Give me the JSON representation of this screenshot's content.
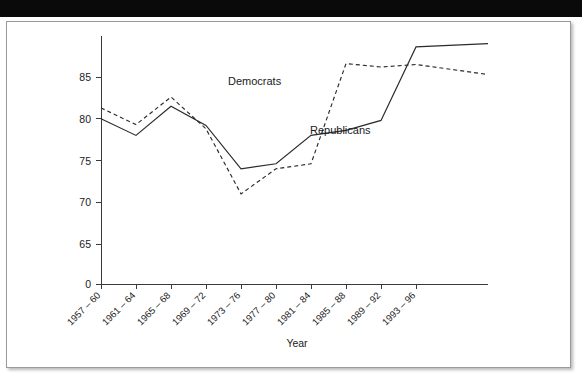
{
  "banner": {
    "label": ""
  },
  "figure": {
    "axis_title_x": "Year",
    "axis_title_y": "",
    "labels": {
      "democrats": "Democrats",
      "republicans": "Republicans"
    }
  },
  "chart_data": {
    "type": "line",
    "title": "",
    "xlabel": "Year",
    "ylabel": "",
    "grid": false,
    "legend": "inline-annotations",
    "ylim": [
      62.5,
      90.5
    ],
    "y_axis_break": true,
    "yticks": [
      0,
      65,
      70,
      75,
      80,
      85
    ],
    "ytick_labels": [
      "0",
      "65",
      "70",
      "75",
      "80",
      "85"
    ],
    "categories": [
      "1957 – 60",
      "1961 – 64",
      "1965 – 68",
      "1969 – 72",
      "1973 – 76",
      "1977 – 80",
      "1981 – 84",
      "1985 – 88",
      "1989 – 92",
      "1993 – 96"
    ],
    "series": [
      {
        "name": "Republicans",
        "style": "solid",
        "values": [
          80.0,
          78.0,
          81.5,
          79.2,
          74.0,
          74.6,
          78.0,
          78.6,
          79.8,
          88.6
        ]
      },
      {
        "name": "Democrats",
        "style": "dashed",
        "values": [
          81.3,
          79.3,
          82.6,
          78.8,
          71.0,
          74.0,
          74.6,
          86.6,
          86.2,
          86.5
        ]
      }
    ],
    "series_extensions": {
      "Republicans": 89.0,
      "Democrats": 85.3
    }
  }
}
